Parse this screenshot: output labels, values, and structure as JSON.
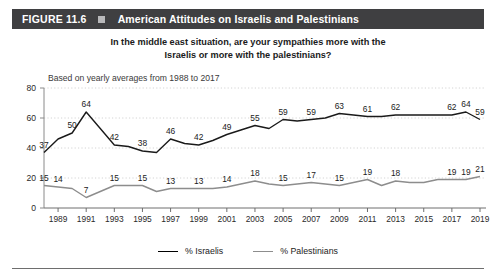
{
  "header": {
    "figure_number": "FIGURE 11.6",
    "square_icon": "square-bullet-icon",
    "title": "American Attitudes on Israelis and Palestinians",
    "bar_color": "#3f3f41"
  },
  "subtitle_line1": "In the middle east situation, are your sympathies more with the",
  "subtitle_line2": "Israelis or more with the palestinians?",
  "note": "Based on yearly averages from 1988 to 2017",
  "legend": {
    "israelis_label": "% Israelis",
    "palestinians_label": "% Palestinians",
    "israelis_color": "#1a1a1a",
    "palestinians_color": "#8d8d8d"
  },
  "chart_data": {
    "type": "line",
    "title": "American Attitudes on Israelis and Palestinians",
    "subtitle": "In the middle east situation, are your sympathies more with the Israelis or more with the palestinians?",
    "annotation": "Based on yearly averages from 1988 to 2017",
    "xlabel": "",
    "ylabel": "",
    "ylim": [
      0,
      80
    ],
    "yticks": [
      0,
      20,
      40,
      60,
      80
    ],
    "ytick_labels": [
      "0",
      "20",
      "40",
      "60",
      "80"
    ],
    "grid": true,
    "grid_style": "dotted-horizontal",
    "legend_position": "bottom-center",
    "x": [
      1988,
      1989,
      1990,
      1991,
      1992,
      1993,
      1994,
      1995,
      1996,
      1997,
      1998,
      1999,
      2000,
      2001,
      2002,
      2003,
      2004,
      2005,
      2006,
      2007,
      2008,
      2009,
      2010,
      2011,
      2012,
      2013,
      2014,
      2015,
      2016,
      2017,
      2018,
      2019
    ],
    "xtick_labels": [
      "1989",
      "1991",
      "1993",
      "1995",
      "1997",
      "1999",
      "2001",
      "2003",
      "2005",
      "2007",
      "2009",
      "2011",
      "2013",
      "2015",
      "2017",
      "2019"
    ],
    "xtick_values": [
      1989,
      1991,
      1993,
      1995,
      1997,
      1999,
      2001,
      2003,
      2005,
      2007,
      2009,
      2011,
      2013,
      2015,
      2017,
      2019
    ],
    "series": [
      {
        "name": "% Israelis",
        "color": "#1a1a1a",
        "values": [
          37,
          46,
          50,
          64,
          53,
          42,
          41,
          38,
          37,
          46,
          43,
          42,
          45,
          49,
          52,
          55,
          53,
          59,
          58,
          59,
          60,
          63,
          62,
          61,
          61,
          62,
          62,
          62,
          62,
          62,
          64,
          59
        ],
        "labeled_points": [
          {
            "x": 1988,
            "value": 37
          },
          {
            "x": 1990,
            "value": 50
          },
          {
            "x": 1991,
            "value": 64
          },
          {
            "x": 1993,
            "value": 42
          },
          {
            "x": 1995,
            "value": 38
          },
          {
            "x": 1997,
            "value": 46
          },
          {
            "x": 1999,
            "value": 42
          },
          {
            "x": 2001,
            "value": 49
          },
          {
            "x": 2003,
            "value": 55
          },
          {
            "x": 2005,
            "value": 59
          },
          {
            "x": 2007,
            "value": 59
          },
          {
            "x": 2009,
            "value": 63
          },
          {
            "x": 2011,
            "value": 61
          },
          {
            "x": 2013,
            "value": 62
          },
          {
            "x": 2017,
            "value": 62
          },
          {
            "x": 2018,
            "value": 64
          },
          {
            "x": 2019,
            "value": 59
          }
        ]
      },
      {
        "name": "% Palestinians",
        "color": "#8d8d8d",
        "values": [
          15,
          14,
          13,
          7,
          11,
          15,
          15,
          15,
          11,
          13,
          13,
          13,
          13,
          14,
          16,
          18,
          16,
          15,
          16,
          17,
          16,
          15,
          17,
          19,
          15,
          18,
          17,
          17,
          19,
          19,
          19,
          21
        ],
        "labeled_points": [
          {
            "x": 1988,
            "value": 15
          },
          {
            "x": 1989,
            "value": 14
          },
          {
            "x": 1991,
            "value": 7
          },
          {
            "x": 1993,
            "value": 15
          },
          {
            "x": 1995,
            "value": 15
          },
          {
            "x": 1997,
            "value": 13
          },
          {
            "x": 1999,
            "value": 13
          },
          {
            "x": 2001,
            "value": 14
          },
          {
            "x": 2003,
            "value": 18
          },
          {
            "x": 2005,
            "value": 15
          },
          {
            "x": 2007,
            "value": 17
          },
          {
            "x": 2009,
            "value": 15
          },
          {
            "x": 2011,
            "value": 19
          },
          {
            "x": 2013,
            "value": 18
          },
          {
            "x": 2017,
            "value": 19
          },
          {
            "x": 2018,
            "value": 19
          },
          {
            "x": 2019,
            "value": 21
          }
        ]
      }
    ]
  }
}
